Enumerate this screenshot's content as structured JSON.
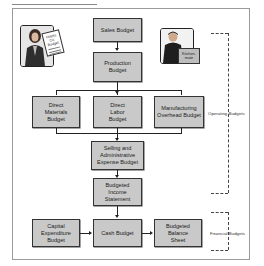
{
  "diagram": {
    "boxes": {
      "sales": "Sales Budget",
      "production": "Production Budget",
      "direct_materials": "Direct Materials Budget",
      "direct_labor": "Direct Labor Budget",
      "mfg_overhead": "Manufacturing Overhead Budget",
      "selling_admin": "Selling and Administrative Expense Budget",
      "income_statement": "Budgeted Income Statement",
      "capital_expenditure": "Capital Expenditure Budget",
      "cash": "Cash Budget",
      "balance_sheet": "Budgeted Balance Sheet"
    },
    "groups": {
      "operating": "Operating Budgets",
      "financial": "Financial Budgets"
    },
    "illustrations": {
      "left_doc_text": "Hayes Co. Budget",
      "right_box_text": "Kitchen-mate"
    }
  }
}
